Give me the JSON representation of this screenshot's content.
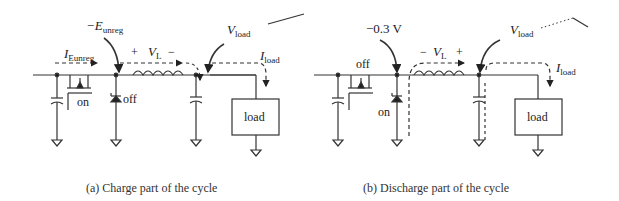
{
  "panels": [
    {
      "id": "a",
      "caption": "(a)  Charge part of the cycle",
      "labels": {
        "node_voltage": "−E",
        "node_voltage_sub": "unreg",
        "input_current": "I",
        "input_current_sub": "Eunreg",
        "inductor_voltage_plus": "+",
        "inductor_voltage": "V",
        "inductor_voltage_sub": "L",
        "inductor_voltage_minus": "−",
        "output_voltage": "V",
        "output_voltage_sub": "load",
        "load_current": "I",
        "load_current_sub": "load",
        "switch_state": "on",
        "diode_state": "off",
        "load_box": "load"
      }
    },
    {
      "id": "b",
      "caption": "(b)  Discharge part of the cycle",
      "labels": {
        "node_voltage": "−0.3 V",
        "inductor_voltage_minus": "−",
        "inductor_voltage": "V",
        "inductor_voltage_sub": "L",
        "inductor_voltage_plus": "+",
        "output_voltage": "V",
        "output_voltage_sub": "load",
        "load_current": "I",
        "load_current_sub": "load",
        "switch_state": "off",
        "diode_state": "on",
        "load_box": "load"
      }
    }
  ]
}
